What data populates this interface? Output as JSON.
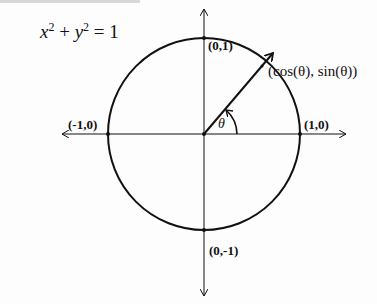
{
  "title": {
    "equation_lhs_x": "x",
    "equation_sup_x": "2",
    "equation_plus": " + ",
    "equation_lhs_y": "y",
    "equation_sup_y": "2",
    "equation_rhs": " = 1"
  },
  "labels": {
    "top": "(0,1)",
    "bottom": "(0,-1)",
    "left": "(-1,0)",
    "right": "(1,0)",
    "point": "(cos(θ), sin(θ))",
    "angle": "θ"
  },
  "colors": {
    "stroke": "#111111",
    "background": "#fdfdfd"
  }
}
